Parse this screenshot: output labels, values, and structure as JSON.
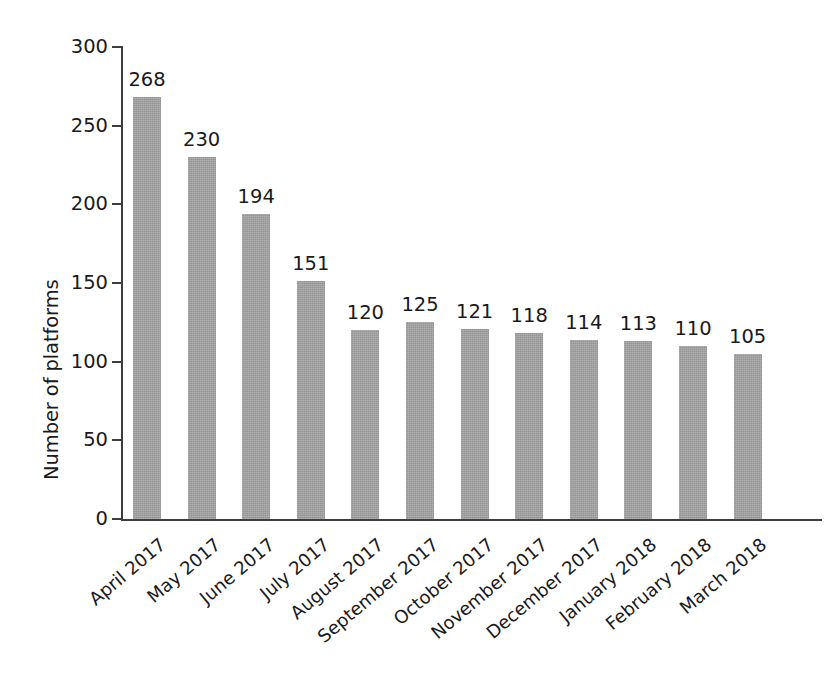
{
  "chart_data": {
    "type": "bar",
    "title": "",
    "xlabel": "",
    "ylabel": "Number of platforms",
    "categories": [
      "April 2017",
      "May 2017",
      "June 2017",
      "July 2017",
      "August 2017",
      "September 2017",
      "October 2017",
      "November 2017",
      "December 2017",
      "January 2018",
      "February 2018",
      "March 2018"
    ],
    "values": [
      268,
      230,
      194,
      151,
      120,
      125,
      121,
      118,
      114,
      113,
      110,
      105
    ],
    "value_labels": [
      "268",
      "230",
      "194",
      "151",
      "120",
      "125",
      "121",
      "118",
      "114",
      "113",
      "110",
      "105"
    ],
    "ylim": [
      0,
      300
    ],
    "yticks": [
      0,
      50,
      100,
      150,
      200,
      250,
      300
    ],
    "ytick_labels": [
      "0",
      "50",
      "100",
      "150",
      "200",
      "250",
      "300"
    ],
    "grid": false,
    "legend": null,
    "bar_color": "#a3a3a3",
    "axis_color": "#3d3d3d",
    "text_color": "#1a1a1a",
    "background_color": "#ffffff"
  }
}
